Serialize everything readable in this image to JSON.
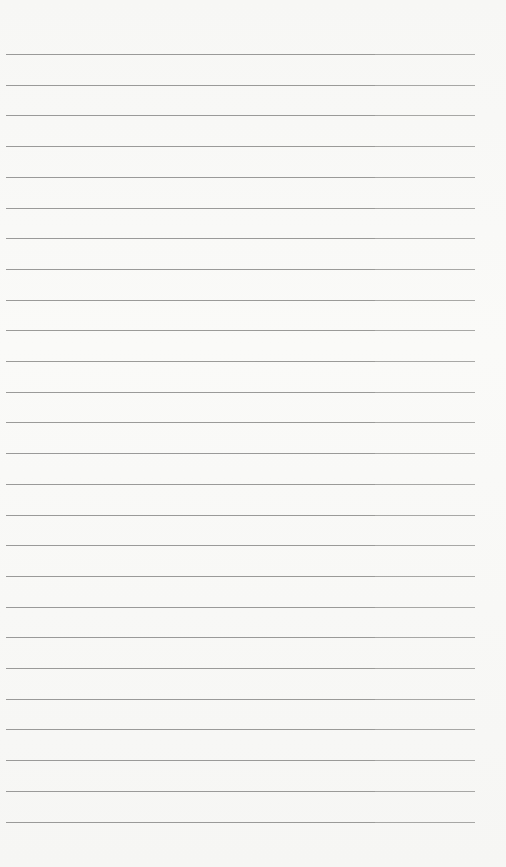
{
  "paper": {
    "line_count": 26,
    "first_line_y": 54,
    "line_spacing": 30.7,
    "line_left": 6,
    "line_right": 475,
    "line_color": "#8a8a88",
    "background_color": "#f8f8f6"
  }
}
